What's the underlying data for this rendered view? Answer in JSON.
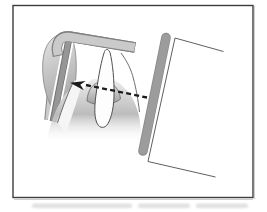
{
  "figure": {
    "alt": "Diagram of intraoral x-ray film placement: a thumb holds a film packet in an L-shaped holder behind a tooth; a dashed central-ray arrow points from the open end of the x-ray tube aperture toward the film",
    "width": 267,
    "height": 212
  },
  "parts": {
    "frame": "illustration frame",
    "thumb": "thumb",
    "film_holder": "L-shaped film holder",
    "film": "x-ray film packet",
    "hand": "hand and fingers",
    "finger": "front finger",
    "fingertip": "fingertip behind tooth",
    "tooth": "tooth",
    "arrow": "central ray dashed arrow",
    "aperture_bar": "x-ray tube aperture bar",
    "tube_outline": "x-ray tube cylinder outline",
    "smudge": "blurred caption remnant"
  },
  "colors": {
    "background": "#ffffff",
    "frame_stroke": "#3c3c3c",
    "frame_shadow": "#c9c9c9",
    "outline": "#5f5f5f",
    "band_fill": "#cacaca",
    "band_edge": "#808080",
    "film_fill": "#969696",
    "film_edge": "#6f6f6f",
    "film_gap": "#ffffff",
    "blob_top": "#e6e6e6",
    "blob_bottom": "#a4a4a4",
    "blob_stroke": "#8d8d8d",
    "mound_top": "#ececec",
    "mound_mid": "#bcbcbc",
    "finger_fill": "#f5f5f5",
    "dome_top": "#e7e7e7",
    "dome_bottom": "#9d9d9d",
    "dome_stroke": "#707070",
    "tooth_fill": "#fdfdfd",
    "tooth_stroke": "#4f4f4f",
    "bar_fill": "#9c9c9c",
    "bar_edge": "#8c8c8c",
    "arrow": "#1c1c1c",
    "smudge": "#c2c2c2"
  }
}
